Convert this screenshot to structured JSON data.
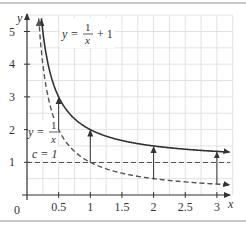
{
  "chart_data": {
    "type": "line",
    "title": "",
    "xlabel": "x",
    "ylabel": "y",
    "xlim": [
      0,
      3.2
    ],
    "ylim": [
      0,
      5.3
    ],
    "x_ticks": [
      "0.5",
      "1",
      "1.5",
      "2",
      "2.5",
      "3"
    ],
    "y_ticks": [
      "1",
      "2",
      "3",
      "4",
      "5"
    ],
    "origin_label": "0",
    "grid": true,
    "series": [
      {
        "name": "y = 1/x + 1",
        "style": "solid",
        "formula": "1/x+1",
        "x": [
          0.25,
          0.5,
          1,
          1.5,
          2,
          2.5,
          3
        ],
        "values": [
          5,
          3,
          2,
          1.667,
          1.5,
          1.4,
          1.333
        ]
      },
      {
        "name": "y = 1/x",
        "style": "dashed",
        "formula": "1/x",
        "x": [
          0.2,
          0.25,
          0.5,
          1,
          1.5,
          2,
          2.5,
          3
        ],
        "values": [
          5,
          4,
          2,
          1,
          0.667,
          0.5,
          0.4,
          0.333
        ]
      },
      {
        "name": "c = 1",
        "style": "dashed",
        "formula": "1",
        "x": [
          0,
          3.2
        ],
        "values": [
          1,
          1
        ]
      }
    ],
    "annotations": [
      {
        "type": "arrow",
        "x": 0.5,
        "from": 2,
        "to": 3
      },
      {
        "type": "arrow",
        "x": 1,
        "from": 1,
        "to": 2
      },
      {
        "type": "arrow",
        "x": 2,
        "from": 0.5,
        "to": 1.5
      },
      {
        "type": "arrow",
        "x": 3,
        "from": 0.333,
        "to": 1.333
      }
    ],
    "labels": {
      "top_curve": "y = 1/x + 1",
      "bottom_curve": "y = 1/x",
      "constant": "c = 1"
    }
  },
  "text": {
    "y_axis": "y",
    "x_axis": "x",
    "origin": "0",
    "top_eq_lhs": "y =",
    "top_eq_num": "1",
    "top_eq_den": "x",
    "top_eq_rhs": "+ 1",
    "bot_eq_lhs": "y =",
    "bot_eq_num": "1",
    "bot_eq_den": "x",
    "c_label": "c = 1",
    "xt": [
      "0.5",
      "1",
      "1.5",
      "2",
      "2.5",
      "3"
    ],
    "yt": [
      "1",
      "2",
      "3",
      "4",
      "5"
    ]
  }
}
